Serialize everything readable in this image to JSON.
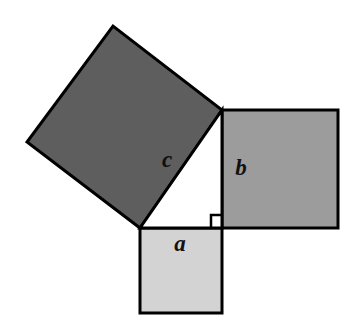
{
  "figure": {
    "name": "pythagorean-theorem-squares",
    "background_color": "#ffffff",
    "outline_color": "#000000",
    "width": 353,
    "height": 327
  },
  "labels": {
    "a": "a",
    "b": "b",
    "c": "c"
  },
  "squares": {
    "a": {
      "label": "a",
      "fill": "#d3d3d3",
      "points": "140,228 222,228 222,313 140,313",
      "label_x": 180,
      "label_y": 246
    },
    "b": {
      "label": "b",
      "fill": "#9c9c9c",
      "points": "222,110 338,110 338,228 222,228",
      "label_x": 241,
      "label_y": 170
    },
    "c": {
      "label": "c",
      "fill": "#5e5e5e",
      "points": "140,228 222,110 113,26 27,142",
      "label_x": 167,
      "label_y": 162
    }
  },
  "triangle": {
    "name": "right-triangle",
    "fill": "#ffffff",
    "points": "140,228 222,228 222,110"
  },
  "right_angle_marker": {
    "name": "right-angle-marker",
    "points": "211,228 211,215 222,215"
  },
  "cropped_header_text": "•        •"
}
